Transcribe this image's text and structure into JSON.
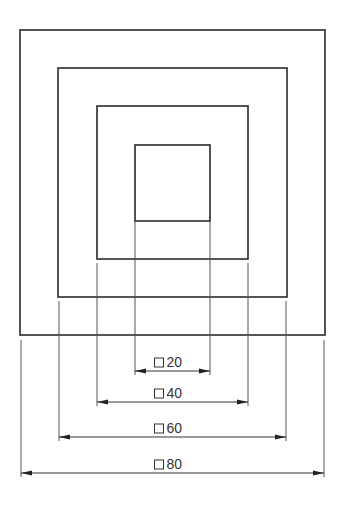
{
  "diagram": {
    "type": "concentric squares with dimensions",
    "squares": [
      {
        "name": "square-80",
        "x": 20,
        "y": 30,
        "w": 305,
        "h": 305
      },
      {
        "name": "square-60",
        "x": 58,
        "y": 68,
        "w": 229,
        "h": 229
      },
      {
        "name": "square-40",
        "x": 97,
        "y": 106,
        "w": 151,
        "h": 153
      },
      {
        "name": "square-20",
        "x": 135,
        "y": 145,
        "w": 75,
        "h": 76
      }
    ],
    "dimensions": [
      {
        "label": "20",
        "symbol": "square",
        "x1": 135,
        "x2": 210,
        "y": 371,
        "ext_from": 221
      },
      {
        "label": "40",
        "symbol": "square",
        "x1": 97,
        "x2": 248,
        "y": 402,
        "ext_from": 263
      },
      {
        "label": "60",
        "symbol": "square",
        "x1": 59,
        "x2": 286,
        "y": 437,
        "ext_from": 301
      },
      {
        "label": "80",
        "symbol": "square",
        "x1": 21,
        "x2": 324,
        "y": 473,
        "ext_from": 340
      }
    ],
    "colors": {
      "line": "#2a2a2a",
      "background": "#ffffff"
    }
  }
}
